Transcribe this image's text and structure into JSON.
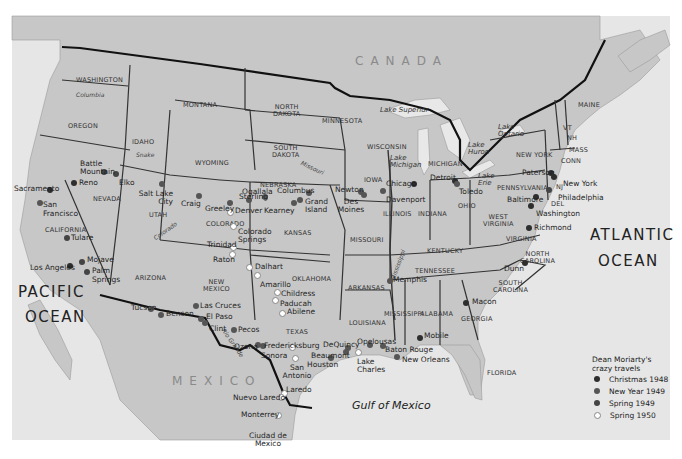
{
  "map": {
    "oceans": [
      {
        "id": "pacific",
        "lines": [
          "PACIFIC",
          "OCEAN"
        ]
      },
      {
        "id": "atlantic",
        "lines": [
          "ATLANTIC",
          "OCEAN"
        ]
      }
    ],
    "water_bodies": {
      "gulf": "Gulf of Mexico",
      "lake_superior": "Lake Superior",
      "lake_michigan": [
        "Lake",
        "Michigan"
      ],
      "lake_huron": [
        "Lake",
        "Huron"
      ],
      "lake_erie": [
        "Lake",
        "Erie"
      ],
      "lake_ontario": [
        "Lake",
        "Ontario"
      ]
    },
    "countries": {
      "canada": "CANADA",
      "mexico": "MEXICO"
    },
    "rivers": {
      "columbia": "Columbia",
      "snake": "Snake",
      "colorado": "Colorado",
      "missouri": "Missouri",
      "mississippi": "Mississippi",
      "rio_grande": "Rio Grande"
    },
    "states": {
      "washington": "WASHINGTON",
      "oregon": "OREGON",
      "idaho": "IDAHO",
      "montana": "MONTANA",
      "wyoming": "WYOMING",
      "north_dakota": [
        "NORTH",
        "DAKOTA"
      ],
      "south_dakota": [
        "SOUTH",
        "DAKOTA"
      ],
      "nebraska": "NEBRASKA",
      "minnesota": "MINNESOTA",
      "iowa": "IOWA",
      "wisconsin": "WISCONSIN",
      "michigan": "MICHIGAN",
      "illinois": "ILLINOIS",
      "indiana": "INDIANA",
      "ohio": "OHIO",
      "new_york": "NEW YORK",
      "pennsylvania": "PENNSYLVANIA",
      "maine": "MAINE",
      "vermont": "VT",
      "new_hampshire": "NH",
      "massachusetts": "MASS",
      "connecticut": "CONN",
      "new_jersey": "NJ",
      "delaware": "DEL",
      "west_virginia": [
        "WEST",
        "VIRGINIA"
      ],
      "virginia": "VIRGINIA",
      "kentucky": "KENTUCKY",
      "tennessee": "TENNESSEE",
      "north_carolina": [
        "NORTH",
        "CAROLINA"
      ],
      "south_carolina": [
        "SOUTH",
        "CAROLINA"
      ],
      "georgia": "GEORGIA",
      "alabama": "ALABAMA",
      "mississippi": "MISSISSIPPI",
      "louisiana": "LOUISIANA",
      "arkansas": "ARKANSAS",
      "missouri": "MISSOURI",
      "kansas": "KANSAS",
      "oklahoma": "OKLAHOMA",
      "texas": "TEXAS",
      "new_mexico": [
        "NEW",
        "MEXICO"
      ],
      "colorado": "COLORADO",
      "utah": "UTAH",
      "arizona": "ARIZONA",
      "nevada": "NEVADA",
      "california": "CALIFORNIA",
      "florida": "FLORIDA"
    },
    "cities": [
      {
        "name": "Sacramento",
        "trip": "xmas",
        "x": 50,
        "y": 190
      },
      {
        "name": "San Francisco",
        "trip": "ny",
        "x": 38,
        "y": 203
      },
      {
        "name": "Tulare",
        "trip": "sp49",
        "x": 67,
        "y": 239
      },
      {
        "name": "Los Angeles",
        "trip": "xmas",
        "x": 69,
        "y": 265
      },
      {
        "name": "Mojave",
        "trip": "sp49",
        "x": 82,
        "y": 261
      },
      {
        "name": "Palm Springs",
        "trip": "sp49",
        "x": 87,
        "y": 272
      },
      {
        "name": "Reno",
        "trip": "xmas",
        "x": 73,
        "y": 183
      },
      {
        "name": "Battle Mountain",
        "trip": "sp49",
        "x": 104,
        "y": 172
      },
      {
        "name": "Elko",
        "trip": "sp49",
        "x": 115,
        "y": 174
      },
      {
        "name": "Salt Lake City",
        "trip": "ny",
        "x": 162,
        "y": 184
      },
      {
        "name": "Craig",
        "trip": "ny",
        "x": 199,
        "y": 196
      },
      {
        "name": "Greeley",
        "trip": "ny",
        "x": 230,
        "y": 203
      },
      {
        "name": "Denver",
        "trip": "sp50",
        "x": 230,
        "y": 211
      },
      {
        "name": "Sterling",
        "trip": "ny",
        "x": 249,
        "y": 200
      },
      {
        "name": "Ogallala",
        "trip": "ny",
        "x": 265,
        "y": 197
      },
      {
        "name": "Colorado Springs",
        "trip": "sp50",
        "x": 233,
        "y": 226
      },
      {
        "name": "Columbus",
        "trip": "ny",
        "x": 309,
        "y": 193
      },
      {
        "name": "Kearney",
        "trip": "ny",
        "x": 293,
        "y": 203
      },
      {
        "name": "Grand Island",
        "trip": "ny",
        "x": 299,
        "y": 200
      },
      {
        "name": "Newton",
        "trip": "ny",
        "x": 361,
        "y": 192
      },
      {
        "name": "Des Moines",
        "trip": "ny",
        "x": 363,
        "y": 195
      },
      {
        "name": "Chicago",
        "trip": "xmas",
        "x": 414,
        "y": 184
      },
      {
        "name": "Davenport",
        "trip": "ny",
        "x": 383,
        "y": 191
      },
      {
        "name": "Detroit",
        "trip": "xmas",
        "x": 455,
        "y": 183
      },
      {
        "name": "Toledo",
        "trip": "ny",
        "x": 456,
        "y": 182
      },
      {
        "name": "New York",
        "trip": "xmas",
        "x": 554,
        "y": 176
      },
      {
        "name": "Paterson",
        "trip": "xmas",
        "x": 551,
        "y": 173
      },
      {
        "name": "Philadelphia",
        "trip": "sp49",
        "x": 549,
        "y": 190
      },
      {
        "name": "Baltimore",
        "trip": "xmas",
        "x": 536,
        "y": 198
      },
      {
        "name": "Washington",
        "trip": "xmas",
        "x": 531,
        "y": 206
      },
      {
        "name": "Richmond",
        "trip": "xmas",
        "x": 529,
        "y": 228
      },
      {
        "name": "Dunn",
        "trip": "xmas",
        "x": 525,
        "y": 263
      },
      {
        "name": "Macon",
        "trip": "xmas",
        "x": 466,
        "y": 302
      },
      {
        "name": "Mobile",
        "trip": "xmas",
        "x": 420,
        "y": 337
      },
      {
        "name": "Memphis",
        "trip": "ny",
        "x": 390,
        "y": 281
      },
      {
        "name": "New Orleans",
        "trip": "ny",
        "x": 397,
        "y": 357
      },
      {
        "name": "Baton Rouge",
        "trip": "ny",
        "x": 383,
        "y": 346
      },
      {
        "name": "Opelousas",
        "trip": "ny",
        "x": 370,
        "y": 345
      },
      {
        "name": "Lake Charles",
        "trip": "sp50",
        "x": 357,
        "y": 352
      },
      {
        "name": "DeQuincy",
        "trip": "ny",
        "x": 348,
        "y": 348
      },
      {
        "name": "Beaumont",
        "trip": "ny",
        "x": 346,
        "y": 351
      },
      {
        "name": "Houston",
        "trip": "ny",
        "x": 331,
        "y": 358
      },
      {
        "name": "Fredericksburg",
        "trip": "sp50",
        "x": 292,
        "y": 347
      },
      {
        "name": "Sonora",
        "trip": "ny",
        "x": 263,
        "y": 345
      },
      {
        "name": "Ozona",
        "trip": "ny",
        "x": 258,
        "y": 345
      },
      {
        "name": "San Antonio",
        "trip": "sp50",
        "x": 295,
        "y": 358
      },
      {
        "name": "Pecos",
        "trip": "ny",
        "x": 234,
        "y": 330
      },
      {
        "name": "Clint",
        "trip": "ny",
        "x": 204,
        "y": 323
      },
      {
        "name": "El Paso",
        "trip": "ny",
        "x": 201,
        "y": 319
      },
      {
        "name": "Las Cruces",
        "trip": "ny",
        "x": 196,
        "y": 306
      },
      {
        "name": "Benson",
        "trip": "ny",
        "x": 161,
        "y": 315
      },
      {
        "name": "Tucson",
        "trip": "ny",
        "x": 151,
        "y": 309
      },
      {
        "name": "Trinidad",
        "trip": "sp50",
        "x": 233,
        "y": 247
      },
      {
        "name": "Raton",
        "trip": "sp50",
        "x": 232,
        "y": 254
      },
      {
        "name": "Dalhart",
        "trip": "sp50",
        "x": 251,
        "y": 267
      },
      {
        "name": "Amarillo",
        "trip": "sp50",
        "x": 257,
        "y": 275
      },
      {
        "name": "Childress",
        "trip": "sp50",
        "x": 277,
        "y": 292
      },
      {
        "name": "Paducah",
        "trip": "sp50",
        "x": 274,
        "y": 300
      },
      {
        "name": "Abilene",
        "trip": "sp50",
        "x": 281,
        "y": 313
      },
      {
        "name": "Laredo",
        "trip": "sp50",
        "x": 283,
        "y": 393
      },
      {
        "name": "Nuevo Laredo",
        "trip": "sp50",
        "x": 281,
        "y": 397
      },
      {
        "name": "Monterrey",
        "trip": "sp50",
        "x": 277,
        "y": 414
      },
      {
        "name": "Ciudad de Mexico",
        "trip": "sp50",
        "x": 0,
        "y": 0
      }
    ]
  },
  "legend": {
    "title_lines": [
      "Dean Moriarty's",
      "crazy travels"
    ],
    "items": [
      {
        "key": "xmas",
        "label": "Christmas 1948",
        "color": "#2e2e2e"
      },
      {
        "key": "ny",
        "label": "New Year 1949",
        "color": "#555555"
      },
      {
        "key": "sp49",
        "label": "Spring 1949",
        "color": "#444444"
      },
      {
        "key": "sp50",
        "label": "Spring 1950",
        "color": "#ffffff"
      }
    ]
  }
}
